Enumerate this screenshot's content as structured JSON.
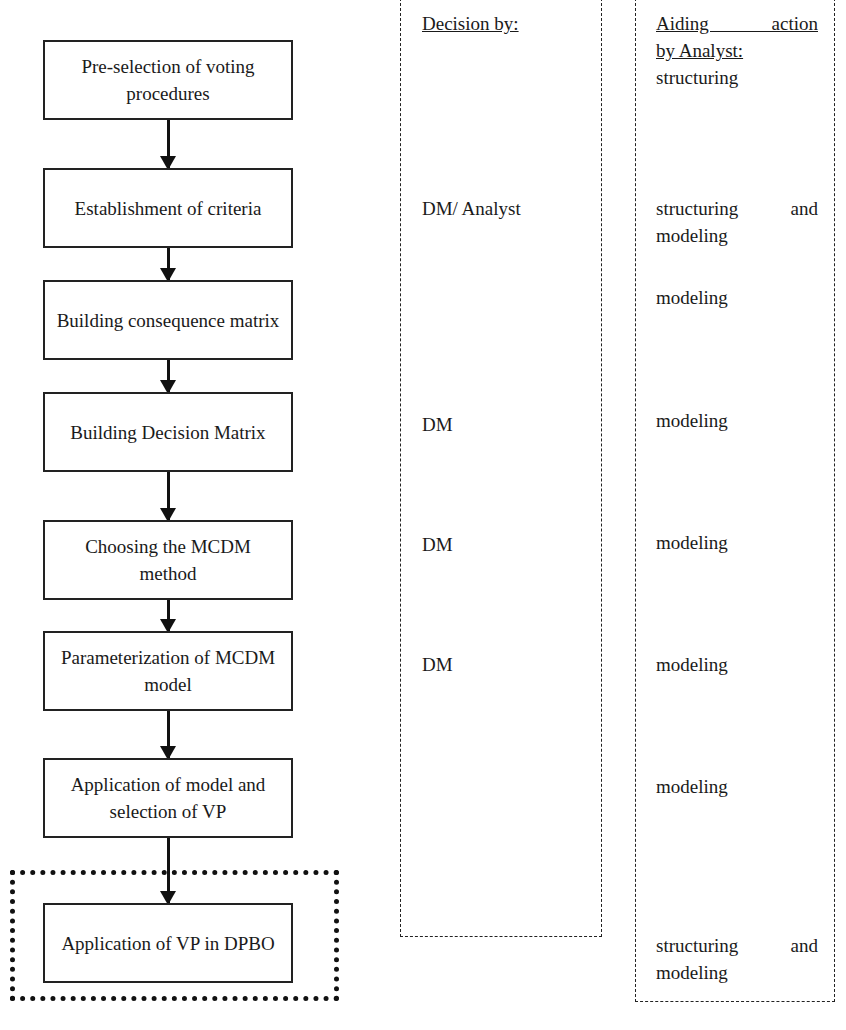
{
  "flowchart": {
    "steps": [
      {
        "label": "Pre-selection of voting procedures"
      },
      {
        "label": "Establishment of criteria"
      },
      {
        "label": "Building consequence matrix"
      },
      {
        "label": "Building Decision Matrix"
      },
      {
        "label": "Choosing the MCDM method"
      },
      {
        "label": "Parameterization of MCDM model"
      },
      {
        "label": "Application of model and selection of VP"
      },
      {
        "label": "Application of VP in DPBO"
      }
    ]
  },
  "decision_panel": {
    "header": "Decision by:",
    "entries": [
      "DM/ Analyst",
      "DM",
      "DM",
      "DM"
    ]
  },
  "aiding_panel": {
    "header_line1": "Aiding action",
    "header_line2": "by Analyst:",
    "entries": [
      "structuring",
      "structuring and",
      "modeling",
      "modeling",
      "modeling",
      "modeling",
      "modeling",
      "modeling",
      "structuring and",
      "modeling"
    ]
  }
}
